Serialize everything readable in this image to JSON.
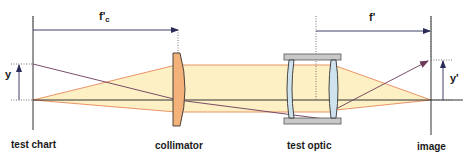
{
  "diagram": {
    "components": [
      {
        "id": "test-chart",
        "label": "test chart"
      },
      {
        "id": "collimator",
        "label": "collimator"
      },
      {
        "id": "test-optic",
        "label": "test optic"
      },
      {
        "id": "image",
        "label": "image"
      }
    ],
    "dimensions": {
      "collimator_focal_length": {
        "symbol": "f'",
        "subscript": "c"
      },
      "test_optic_focal_length": {
        "symbol": "f'"
      },
      "object_height": {
        "symbol": "y"
      },
      "image_height": {
        "symbol": "y'"
      }
    },
    "colors": {
      "beam_fill": "#fdf0c4",
      "beam_edge": "#e8885a",
      "collimator_fill": "#f2b27a",
      "lens_fill": "#cfe3ee",
      "mount_fill": "#c8c8c8",
      "chief_ray": "#6b3a5a",
      "axis": "#333333",
      "dim_line": "#4a4a7a"
    }
  }
}
